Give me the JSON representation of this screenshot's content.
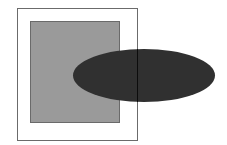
{
  "diagram": {
    "background": "#ffffff",
    "shapes": [
      {
        "id": "outer-frame",
        "type": "rect",
        "x": 17.5,
        "y": 8.5,
        "width": 120,
        "height": 132,
        "fill": "#ffffff",
        "stroke": "#6b6b6b"
      },
      {
        "id": "inner-rect",
        "type": "rect",
        "x": 30.5,
        "y": 21.5,
        "width": 89,
        "height": 101,
        "fill": "#9a9a9a",
        "stroke": "#6a6a6a"
      },
      {
        "id": "ellipse",
        "type": "ellipse",
        "cx": 144,
        "cy": 75.5,
        "rx": 71,
        "ry": 26.5,
        "fill": "#303030",
        "stroke": "#2a2a2a"
      }
    ]
  }
}
